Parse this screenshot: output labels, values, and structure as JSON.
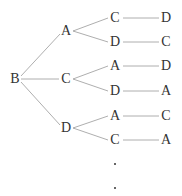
{
  "diagram": {
    "type": "tree",
    "root": "B",
    "nodes": [
      {
        "id": "root",
        "label": "B",
        "x": 15,
        "y": 79
      },
      {
        "id": "l1a",
        "label": "A",
        "x": 66,
        "y": 31
      },
      {
        "id": "l1b",
        "label": "C",
        "x": 66,
        "y": 79
      },
      {
        "id": "l1c",
        "label": "D",
        "x": 66,
        "y": 128
      },
      {
        "id": "l2a",
        "label": "C",
        "x": 115,
        "y": 18
      },
      {
        "id": "l2b",
        "label": "D",
        "x": 115,
        "y": 42
      },
      {
        "id": "l2c",
        "label": "A",
        "x": 115,
        "y": 66
      },
      {
        "id": "l2d",
        "label": "D",
        "x": 115,
        "y": 91
      },
      {
        "id": "l2e",
        "label": "A",
        "x": 115,
        "y": 116
      },
      {
        "id": "l2f",
        "label": "C",
        "x": 115,
        "y": 140
      },
      {
        "id": "l3a",
        "label": "D",
        "x": 166,
        "y": 18
      },
      {
        "id": "l3b",
        "label": "C",
        "x": 166,
        "y": 42
      },
      {
        "id": "l3c",
        "label": "D",
        "x": 166,
        "y": 66
      },
      {
        "id": "l3d",
        "label": "A",
        "x": 166,
        "y": 91
      },
      {
        "id": "l3e",
        "label": "C",
        "x": 166,
        "y": 116
      },
      {
        "id": "l3f",
        "label": "A",
        "x": 166,
        "y": 140
      }
    ],
    "continuation": "· ·"
  }
}
